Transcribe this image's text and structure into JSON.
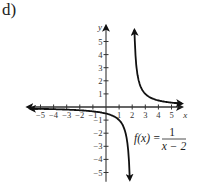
{
  "panel_label": "d)",
  "chart_data": {
    "type": "line",
    "title": "",
    "function_label": "f(x) = 1/(x - 2)",
    "function_label_parts": {
      "lhs": "f(x) =",
      "numerator": "1",
      "denominator": "x − 2"
    },
    "xlabel": "x",
    "ylabel": "y",
    "xlim": [
      -5.5,
      5.5
    ],
    "ylim": [
      -5.5,
      5.5
    ],
    "x_ticks": [
      -5,
      -4,
      -3,
      -2,
      -1,
      1,
      2,
      3,
      4,
      5
    ],
    "y_ticks": [
      -5,
      -4,
      -3,
      -2,
      -1,
      1,
      2,
      3,
      4,
      5
    ],
    "x_tick_labels": [
      "−5",
      "−4",
      "−3",
      "−2",
      "−1",
      "1",
      "2",
      "3",
      "4",
      "5"
    ],
    "y_tick_labels": [
      "−5",
      "−4",
      "−3",
      "−2",
      "−1",
      "1",
      "2",
      "3",
      "4",
      "5"
    ],
    "grid": false,
    "vertical_asymptote": 2,
    "horizontal_asymptote": 0,
    "series": [
      {
        "name": "left branch",
        "x": [
          -5.5,
          -4,
          -3,
          -2,
          -1,
          0,
          1,
          1.5,
          1.8
        ],
        "y": [
          -0.13,
          -0.17,
          -0.2,
          -0.25,
          -0.33,
          -0.5,
          -1,
          -2,
          -5
        ]
      },
      {
        "name": "right branch",
        "x": [
          2.2,
          2.5,
          3,
          4,
          5,
          5.5
        ],
        "y": [
          5,
          2,
          1,
          0.5,
          0.33,
          0.29
        ]
      }
    ]
  }
}
